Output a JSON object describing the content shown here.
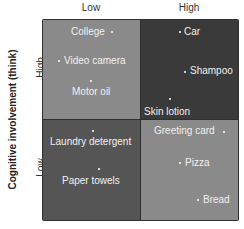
{
  "columns": {
    "low": "Low",
    "high": "High"
  },
  "axis_title": "Cognitive involvement (think)",
  "rows": {
    "high": "High",
    "low": "Low"
  },
  "colors": {
    "q_tl": "#8a8a8a",
    "q_tr": "#3a3a3a",
    "q_bl": "#555555",
    "q_br": "#8a8a8a"
  },
  "quadrants": {
    "top_left": [
      "College",
      "Video camera",
      "Motor oil"
    ],
    "top_right": [
      "Car",
      "Shampoo",
      "Skin lotion"
    ],
    "bottom_left": [
      "Laundry detergent",
      "Paper towels"
    ],
    "bottom_right": [
      "Greeting card",
      "Pizza",
      "Bread"
    ]
  }
}
